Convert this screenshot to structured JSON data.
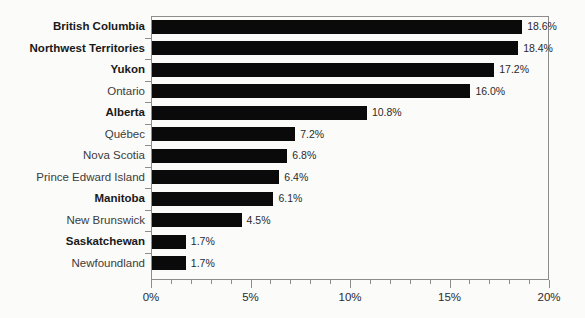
{
  "chart_data": {
    "type": "bar",
    "orientation": "horizontal",
    "title": "",
    "subtitle": "",
    "xlabel": "",
    "ylabel": "",
    "xlim": [
      0,
      20
    ],
    "xtick_labels": [
      "0%",
      "5%",
      "10%",
      "15%",
      "20%"
    ],
    "xtick_values": [
      0,
      5,
      10,
      15,
      20
    ],
    "xtick_minor_step": 1,
    "grid": false,
    "legend": null,
    "bar_color": "#0a0a0a",
    "frame_color": "#8c8c8c",
    "value_label_suffix": "%",
    "categories": [
      "British Columbia",
      "Northwest Territories",
      "Yukon",
      "Ontario",
      "Alberta",
      "Québec",
      "Nova Scotia",
      "Prince Edward Island",
      "Manitoba",
      "New Brunswick",
      "Saskatchewan",
      "Newfoundland"
    ],
    "values": [
      18.6,
      18.4,
      17.2,
      16.0,
      10.8,
      7.2,
      6.8,
      6.4,
      6.1,
      4.5,
      1.7,
      1.7
    ],
    "value_labels": [
      "18.6%",
      "18.4%",
      "17.2%",
      "16.0%",
      "10.8%",
      "7.2%",
      "6.8%",
      "6.4%",
      "6.1%",
      "4.5%",
      "1.7%",
      "1.7%"
    ],
    "emphasized_categories": [
      "British Columbia",
      "Northwest Territories",
      "Yukon",
      "Alberta",
      "Manitoba",
      "Saskatchewan"
    ]
  }
}
